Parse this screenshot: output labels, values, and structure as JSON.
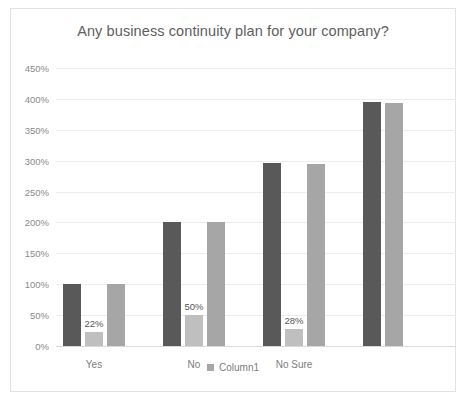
{
  "chart": {
    "title": "Any business continuity plan for your company?",
    "legend_marker": "legend-swatch"
  },
  "chart_data": {
    "type": "bar",
    "title": "Any business continuity plan for your company?",
    "xlabel": "",
    "ylabel": "",
    "ylim": [
      0,
      450
    ],
    "ytick_suffix": "%",
    "yticks": [
      "0%",
      "50%",
      "100%",
      "150%",
      "200%",
      "250%",
      "300%",
      "350%",
      "400%",
      "450%"
    ],
    "ytick_values": [
      0,
      50,
      100,
      150,
      200,
      250,
      300,
      350,
      400,
      450
    ],
    "grid": true,
    "legend": [
      "Column1"
    ],
    "legend_position": "bottom",
    "categories": [
      "Yes",
      "No",
      "No Sure",
      ""
    ],
    "series": [
      {
        "name": "Series1",
        "color": "#595959",
        "values": [
          100,
          200,
          297,
          395
        ]
      },
      {
        "name": "Column1",
        "color": "#bfbfbf",
        "values": [
          22,
          50,
          28,
          null
        ]
      },
      {
        "name": "Series3",
        "color": "#a6a6a6",
        "values": [
          100,
          200,
          295,
          393
        ]
      }
    ],
    "data_labels": [
      {
        "category": "Yes",
        "series": "Column1",
        "text": "22%",
        "value": 22
      },
      {
        "category": "No",
        "series": "Column1",
        "text": "50%",
        "value": 50
      },
      {
        "category": "No Sure",
        "series": "Column1",
        "text": "28%",
        "value": 28
      }
    ]
  }
}
